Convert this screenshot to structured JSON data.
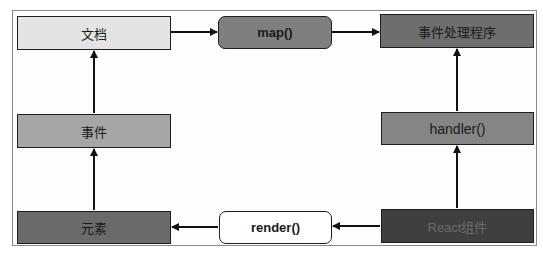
{
  "diagram": {
    "nodes": {
      "document": {
        "label": "文档",
        "fill": "#e4e4e4",
        "text": "#222222"
      },
      "map": {
        "label": "map()",
        "fill": "#7f7f7f",
        "text": "#111111"
      },
      "event_handler": {
        "label": "事件处理程序",
        "fill": "#6e6e6e",
        "text": "#1a1a1a"
      },
      "event": {
        "label": "事件",
        "fill": "#a6a6a6",
        "text": "#1a1a1a"
      },
      "handler": {
        "label": "handler()",
        "fill": "#858585",
        "text": "#111111"
      },
      "element": {
        "label": "元素",
        "fill": "#6a6a6a",
        "text": "#1a1a1a"
      },
      "render": {
        "label": "render()",
        "fill": "#ffffff",
        "text": "#111111"
      },
      "react_component": {
        "label": "React组件",
        "fill": "#3f3f3f",
        "text": "#6b6b6b"
      }
    },
    "edges": [
      {
        "from": "document",
        "to": "map"
      },
      {
        "from": "map",
        "to": "event_handler"
      },
      {
        "from": "event",
        "to": "document"
      },
      {
        "from": "element",
        "to": "event"
      },
      {
        "from": "render",
        "to": "element"
      },
      {
        "from": "react_component",
        "to": "render"
      },
      {
        "from": "react_component",
        "to": "handler"
      },
      {
        "from": "handler",
        "to": "event_handler"
      }
    ]
  }
}
